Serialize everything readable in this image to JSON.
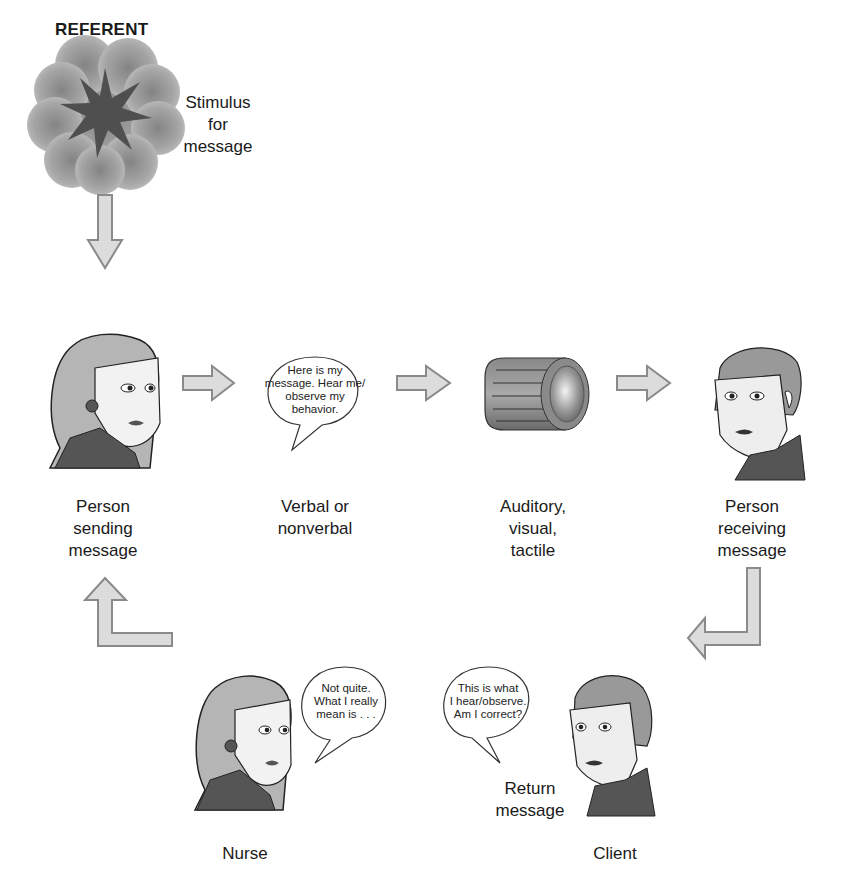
{
  "referent": {
    "title": "REFERENT",
    "stimulus_lines": [
      "Stimulus",
      "for",
      "message"
    ]
  },
  "stages": [
    {
      "id": "sender",
      "title": "Sender",
      "caption_lines": [
        "Person",
        "sending",
        "message"
      ],
      "icon": "woman-face-icon"
    },
    {
      "id": "message",
      "title": "Message",
      "caption_lines": [
        "Verbal or",
        "nonverbal"
      ],
      "bubble_lines": [
        "Here is my",
        "message. Hear me/",
        "observe my",
        "behavior."
      ],
      "icon": "speech-bubble-icon"
    },
    {
      "id": "medium",
      "title": "Medium",
      "caption_lines": [
        "Auditory,",
        "visual,",
        "tactile"
      ],
      "icon": "cylinder-icon"
    },
    {
      "id": "receiver",
      "title": "Receiver",
      "caption_lines": [
        "Person",
        "receiving",
        "message"
      ],
      "icon": "man-face-icon"
    }
  ],
  "feedback": {
    "title": "Feedback",
    "nurse_bubble_lines": [
      "Not quite.",
      "What I really",
      "mean is . . ."
    ],
    "client_bubble_lines": [
      "This is what",
      "I hear/observe.",
      "Am I correct?"
    ],
    "return_message_lines": [
      "Return",
      "message"
    ],
    "nurse_label": "Nurse",
    "client_label": "Client"
  },
  "colors": {
    "header_gray": "#5b5b5b",
    "arrow_fill": "#d9d9d9",
    "arrow_stroke": "#8a8a8a",
    "cloud": "#9a9a9a",
    "star": "#555555"
  }
}
